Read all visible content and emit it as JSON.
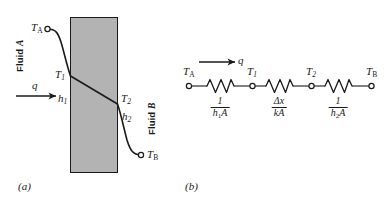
{
  "figure": {
    "type": "thermal-resistance-diagram",
    "panels": [
      {
        "id": "a",
        "caption": "(a)",
        "description": "Temperature profile through a plane wall with convection on both surfaces",
        "wall": {
          "fill_color": "#b3b3b3",
          "edge_color": "#1a1a1a"
        },
        "labels": {
          "fluid_a": "Fluid A",
          "fluid_b": "Fluid B",
          "t_a": "T",
          "t_a_sub": "A",
          "t_1": "T",
          "t_1_sub": "1",
          "t_2": "T",
          "t_2_sub": "2",
          "t_b": "T",
          "t_b_sub": "B",
          "h_1": "h",
          "h_1_sub": "1",
          "h_2": "h",
          "h_2_sub": "2",
          "q": "q"
        }
      },
      {
        "id": "b",
        "caption": "(b)",
        "description": "Equivalent thermal resistance network",
        "flow_label": "q",
        "nodes": [
          {
            "name": "node-ta",
            "symbol": "T",
            "subscript": "A"
          },
          {
            "name": "node-t1",
            "symbol": "T",
            "subscript": "1"
          },
          {
            "name": "node-t2",
            "symbol": "T",
            "subscript": "2"
          },
          {
            "name": "node-tb",
            "symbol": "T",
            "subscript": "B"
          }
        ],
        "resistors": [
          {
            "name": "convection-resistance-inner",
            "numerator": "1",
            "denominator": "h",
            "denominator_sub": "1",
            "denominator_tail": "A"
          },
          {
            "name": "conduction-resistance-wall",
            "numerator": "Δx",
            "denominator": "k",
            "denominator_sub": "",
            "denominator_tail": "A"
          },
          {
            "name": "convection-resistance-outer",
            "numerator": "1",
            "denominator": "h",
            "denominator_sub": "2",
            "denominator_tail": "A"
          }
        ]
      }
    ]
  },
  "colors": {
    "wall_fill": "#b3b3b3",
    "line": "#1a1a1a",
    "background": "#ffffff"
  }
}
